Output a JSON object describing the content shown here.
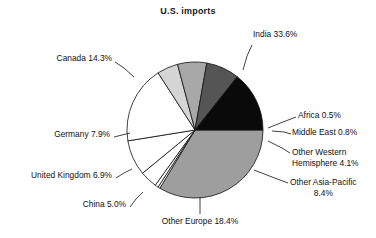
{
  "chart_data": {
    "type": "pie",
    "title": "U.S. imports",
    "xlabel": "",
    "ylabel": "",
    "legend_position": "callout-labels",
    "grid": false,
    "units": "percent",
    "categories": [
      "India",
      "Africa",
      "Middle East",
      "Other Western Hemisphere",
      "Other Asia-Pacific",
      "Other Europe",
      "China",
      "United Kingdom",
      "Germany",
      "Canada"
    ],
    "values": [
      33.6,
      0.5,
      0.8,
      4.1,
      8.4,
      18.4,
      5.0,
      6.9,
      7.9,
      14.3
    ],
    "slice_colors": [
      "#9e9e9e",
      "#ffffff",
      "#ffffff",
      "#ffffff",
      "#ffffff",
      "#ffffff",
      "#d5d5d5",
      "#a8a8a8",
      "#555555",
      "#0a0a0a"
    ],
    "labels": [
      "India 33.6%",
      "Africa 0.5%",
      "Middle East 0.8%",
      "Other Western Hemisphere 4.1%",
      "Other Asia-Pacific 8.4%",
      "Other Europe 18.4%",
      "China 5.0%",
      "United Kingdom 6.9%",
      "Germany 7.9%",
      "Canada 14.3%"
    ],
    "start_angle_deg": 0,
    "direction": "clockwise"
  },
  "labels": {
    "india": "India 33.6%",
    "africa": "Africa 0.5%",
    "middle_east": "Middle East 0.8%",
    "other_western_hemisphere_line1": "Other Western",
    "other_western_hemisphere_line2": "Hemisphere 4.1%",
    "other_asia_pacific_line1": "Other Asia-Pacific",
    "other_asia_pacific_line2": "8.4%",
    "other_europe": "Other Europe 18.4%",
    "china": "China 5.0%",
    "united_kingdom": "United Kingdom 6.9%",
    "germany": "Germany 7.9%",
    "canada": "Canada 14.3%"
  },
  "style": {
    "outline_color": "#111111",
    "background": "#ffffff",
    "text_color": "#111111"
  }
}
